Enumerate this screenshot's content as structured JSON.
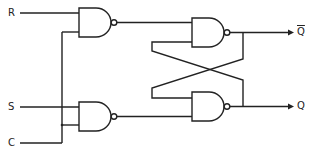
{
  "diagram": {
    "type": "Clocked SR latch (NAND gates)",
    "inputs": [
      {
        "id": "R",
        "label": "R"
      },
      {
        "id": "S",
        "label": "S"
      },
      {
        "id": "C",
        "label": "C"
      }
    ],
    "outputs": [
      {
        "id": "Qbar",
        "label": "Q"
      },
      {
        "id": "Q",
        "label": "Q"
      }
    ],
    "gates": [
      {
        "id": "nand1",
        "type": "NAND",
        "inputs": [
          "R",
          "C"
        ]
      },
      {
        "id": "nand2",
        "type": "NAND",
        "inputs": [
          "S",
          "C"
        ]
      },
      {
        "id": "nand3",
        "type": "NAND",
        "inputs": [
          "nand1",
          "nand4"
        ],
        "output": "Qbar"
      },
      {
        "id": "nand4",
        "type": "NAND",
        "inputs": [
          "nand3",
          "nand2"
        ],
        "output": "Q"
      }
    ],
    "colors": {
      "line": "#222222",
      "background": "#ffffff"
    }
  }
}
